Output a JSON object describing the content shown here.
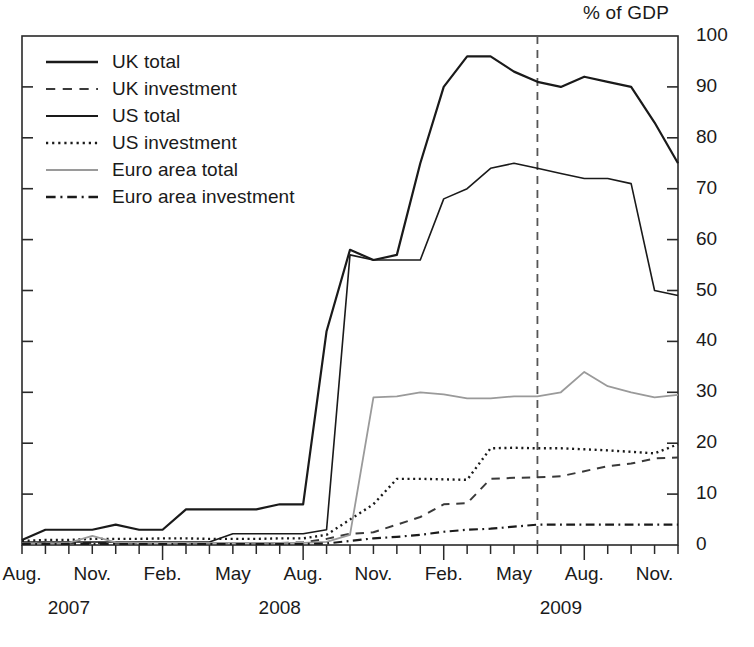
{
  "chart_data": {
    "type": "line",
    "title": "",
    "ylabel": "% of GDP",
    "xlabel": "",
    "ylim": [
      0,
      100
    ],
    "yticks": [
      0,
      10,
      20,
      30,
      40,
      50,
      60,
      70,
      80,
      90,
      100
    ],
    "grid": false,
    "legend_position": "top-left",
    "x": [
      "Aug. 2007",
      "Sep. 2007",
      "Oct. 2007",
      "Nov. 2007",
      "Dec. 2007",
      "Jan. 2008",
      "Feb. 2008",
      "Mar. 2008",
      "Apr. 2008",
      "May 2008",
      "Jun. 2008",
      "Jul. 2008",
      "Aug. 2008",
      "Sep. 2008",
      "Oct. 2008",
      "Nov. 2008",
      "Dec. 2008",
      "Jan. 2009",
      "Feb. 2009",
      "Mar. 2009",
      "Apr. 2009",
      "May 2009",
      "Jun. 2009",
      "Jul. 2009",
      "Aug. 2009",
      "Sep. 2009",
      "Oct. 2009",
      "Nov. 2009",
      "Dec. 2009"
    ],
    "xtick_labels": [
      "Aug.",
      "Nov.",
      "Feb.",
      "May",
      "Aug.",
      "Nov.",
      "Feb.",
      "May",
      "Aug.",
      "Nov."
    ],
    "xtick_indices": [
      0,
      3,
      6,
      9,
      12,
      15,
      18,
      21,
      24,
      27
    ],
    "xyear_labels": [
      "2007",
      "2008",
      "2009"
    ],
    "xyear_indices": [
      2,
      11,
      23
    ],
    "annotations": [
      {
        "name": "vertical-dashed-marker",
        "x_index": 22,
        "label": ""
      }
    ],
    "series": [
      {
        "name": "UK total",
        "style": "solid",
        "color": "#1a1a1a",
        "width": 2.2,
        "values": [
          1,
          3,
          3,
          3,
          4,
          3,
          3,
          7,
          7,
          7,
          7,
          8,
          8,
          42,
          58,
          56,
          57,
          75,
          90,
          96,
          96,
          93,
          91,
          90,
          92,
          91,
          90,
          83,
          75
        ]
      },
      {
        "name": "UK investment",
        "style": "dashed",
        "color": "#3a3a3a",
        "width": 2.0,
        "values": [
          0.4,
          0.4,
          0.4,
          0.4,
          0.4,
          0.4,
          0.4,
          0.4,
          0.4,
          0.4,
          0.4,
          0.4,
          0.5,
          1.2,
          2.2,
          2.5,
          4.0,
          5.5,
          8.0,
          8.2,
          13.0,
          13.2,
          13.3,
          13.5,
          14.5,
          15.5,
          16.0,
          17.0,
          17.2
        ]
      },
      {
        "name": "US total",
        "style": "solid",
        "color": "#1a1a1a",
        "width": 1.6,
        "values": [
          0.6,
          0.6,
          0.6,
          0.6,
          0.6,
          0.6,
          0.6,
          0.6,
          0.6,
          2.2,
          2.2,
          2.2,
          2.2,
          3.0,
          57,
          56,
          56,
          56,
          68,
          70,
          74,
          75,
          74,
          73,
          72,
          72,
          71,
          50,
          49
        ]
      },
      {
        "name": "US investment",
        "style": "dotted",
        "color": "#1a1a1a",
        "width": 2.4,
        "values": [
          0.8,
          1.0,
          1.0,
          1.2,
          1.2,
          1.2,
          1.3,
          1.3,
          1.2,
          1.2,
          1.2,
          1.3,
          1.3,
          2.0,
          5.0,
          8.0,
          13.0,
          13.0,
          12.9,
          12.8,
          19.0,
          19.1,
          19.0,
          19.0,
          18.8,
          18.6,
          18.3,
          18.0,
          19.8
        ]
      },
      {
        "name": "Euro area  total",
        "style": "solid",
        "color": "#9a9a9a",
        "width": 1.8,
        "values": [
          0.3,
          0.3,
          0.4,
          1.8,
          0.5,
          0.4,
          0.4,
          0.4,
          0.4,
          0.4,
          0.4,
          0.4,
          0.4,
          0.6,
          2.0,
          29,
          29.2,
          30.0,
          29.6,
          28.8,
          28.8,
          29.2,
          29.2,
          30.0,
          34.0,
          31.2,
          30.0,
          29.0,
          29.5
        ]
      },
      {
        "name": "Euro area investment",
        "style": "dashdot",
        "color": "#1a1a1a",
        "width": 2.2,
        "values": [
          0.2,
          0.2,
          0.2,
          0.2,
          0.2,
          0.2,
          0.2,
          0.2,
          0.2,
          0.2,
          0.2,
          0.2,
          0.2,
          0.3,
          0.8,
          1.3,
          1.6,
          2.0,
          2.6,
          3.0,
          3.2,
          3.6,
          4.0,
          4.0,
          4.0,
          4.0,
          4.0,
          4.0,
          4.0
        ]
      }
    ]
  },
  "legend": {
    "items": [
      {
        "label": "UK total",
        "style": "solid",
        "color": "#1a1a1a",
        "width": 2.4
      },
      {
        "label": "UK investment",
        "style": "dashed",
        "color": "#3a3a3a",
        "width": 2.2
      },
      {
        "label": "US total",
        "style": "solid",
        "color": "#1a1a1a",
        "width": 1.8
      },
      {
        "label": "US investment",
        "style": "dotted",
        "color": "#1a1a1a",
        "width": 2.6
      },
      {
        "label": "Euro area  total",
        "style": "solid",
        "color": "#9a9a9a",
        "width": 1.8
      },
      {
        "label": "Euro area investment",
        "style": "dashdot",
        "color": "#1a1a1a",
        "width": 2.4
      }
    ]
  },
  "axis_frame": {
    "color": "#2a2a2a",
    "marker_color": "#555555"
  }
}
